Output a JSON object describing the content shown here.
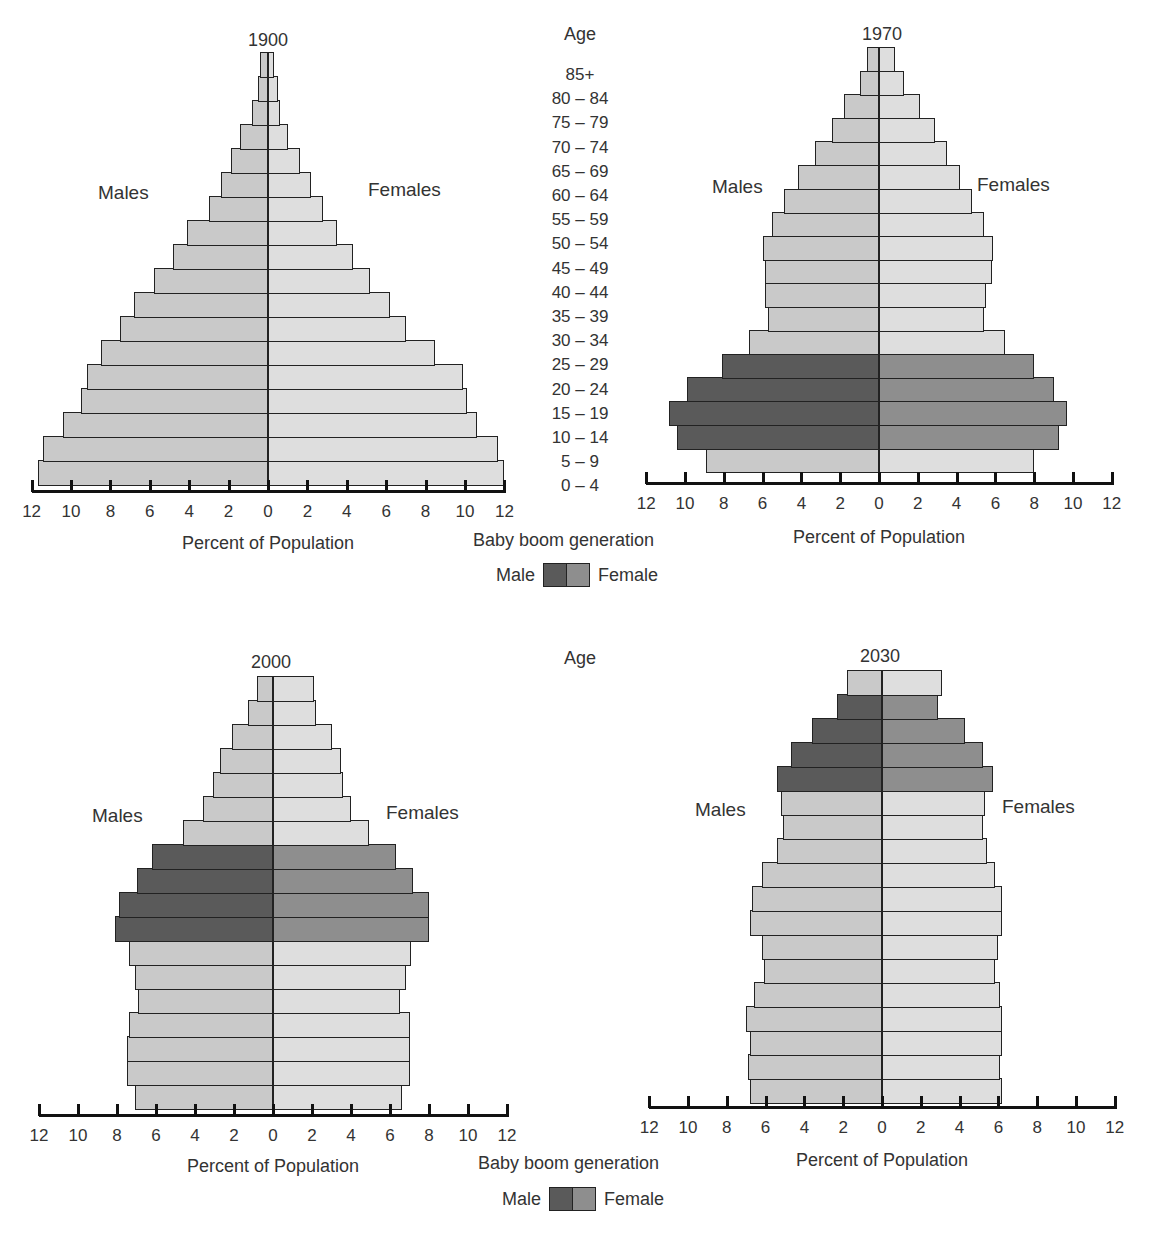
{
  "chart_data": [
    {
      "type": "bar",
      "subtype": "population-pyramid",
      "title": "1900",
      "xlabel": "Percent of Population",
      "xlim": [
        -12,
        12
      ],
      "xticks": [
        12,
        10,
        8,
        6,
        4,
        2,
        0,
        2,
        4,
        6,
        8,
        10,
        12
      ],
      "side_labels": {
        "left": "Males",
        "right": "Females"
      },
      "categories": [
        "0 – 4",
        "5 – 9",
        "10 – 14",
        "15 – 19",
        "20 – 24",
        "25 – 29",
        "30 – 34",
        "35 – 39",
        "40 – 44",
        "45 – 49",
        "50 – 54",
        "55 – 59",
        "60 – 64",
        "65 – 69",
        "70 – 74",
        "75 – 79",
        "80 – 84",
        "85+"
      ],
      "series": [
        {
          "name": "Males",
          "values": [
            11.7,
            11.4,
            10.4,
            9.5,
            9.2,
            8.5,
            7.5,
            6.8,
            5.8,
            4.8,
            4.1,
            3.0,
            2.4,
            1.9,
            1.4,
            0.8,
            0.5,
            0.4
          ]
        },
        {
          "name": "Females",
          "values": [
            12.0,
            11.7,
            10.6,
            10.1,
            9.9,
            8.5,
            7.0,
            6.2,
            5.2,
            4.3,
            3.5,
            2.8,
            2.2,
            1.6,
            1.0,
            0.6,
            0.5,
            0.3
          ]
        }
      ],
      "baby_boom_indices": []
    },
    {
      "type": "bar",
      "subtype": "population-pyramid",
      "title": "1970",
      "xlabel": "Percent of Population",
      "xlim": [
        -12,
        12
      ],
      "xticks": [
        12,
        10,
        8,
        6,
        4,
        2,
        0,
        2,
        4,
        6,
        8,
        10,
        12
      ],
      "side_labels": {
        "left": "Males",
        "right": "Females"
      },
      "categories": [
        "0 – 4",
        "5 – 9",
        "10 – 14",
        "15 – 19",
        "20 – 24",
        "25 – 29",
        "30 – 34",
        "35 – 39",
        "40 – 44",
        "45 – 49",
        "50 – 54",
        "55 – 59",
        "60 – 64",
        "65 – 69",
        "70 – 74",
        "75 – 79",
        "80 – 84",
        "85+"
      ],
      "series": [
        {
          "name": "Males",
          "values": [
            8.9,
            10.4,
            10.8,
            9.9,
            8.1,
            6.7,
            5.7,
            5.9,
            5.9,
            6.0,
            5.5,
            4.9,
            4.2,
            3.3,
            2.4,
            1.8,
            1.0,
            0.6
          ]
        },
        {
          "name": "Females",
          "values": [
            8.0,
            9.3,
            9.7,
            9.0,
            8.0,
            6.5,
            5.4,
            5.5,
            5.8,
            5.9,
            5.4,
            4.8,
            4.2,
            3.5,
            2.9,
            2.1,
            1.3,
            0.8
          ]
        }
      ],
      "baby_boom_indices": [
        1,
        2,
        3,
        4
      ]
    },
    {
      "type": "bar",
      "subtype": "population-pyramid",
      "title": "2000",
      "xlabel": "Percent of Population",
      "xlim": [
        -12,
        12
      ],
      "xticks": [
        12,
        10,
        8,
        6,
        4,
        2,
        0,
        2,
        4,
        6,
        8,
        10,
        12
      ],
      "side_labels": {
        "left": "Males",
        "right": "Females"
      },
      "categories": [
        "0 – 4",
        "5 – 9",
        "10 – 14",
        "15 – 19",
        "20 – 24",
        "25 – 29",
        "30 – 34",
        "35 – 39",
        "40 – 44",
        "45 – 49",
        "50 – 54",
        "55 – 59",
        "60 – 64",
        "65 – 69",
        "70 – 74",
        "75 – 79",
        "80 – 84",
        "85+"
      ],
      "series": [
        {
          "name": "Males",
          "values": [
            7.1,
            7.5,
            7.5,
            7.4,
            6.9,
            7.1,
            7.4,
            8.1,
            7.9,
            7.0,
            6.2,
            4.6,
            3.6,
            3.1,
            2.7,
            2.1,
            1.3,
            0.8
          ]
        },
        {
          "name": "Females",
          "values": [
            6.6,
            7.0,
            7.0,
            7.0,
            6.5,
            6.8,
            7.1,
            8.0,
            8.0,
            7.2,
            6.3,
            4.9,
            4.0,
            3.6,
            3.5,
            3.0,
            2.2,
            2.1
          ]
        }
      ],
      "baby_boom_indices": [
        7,
        8,
        9,
        10
      ]
    },
    {
      "type": "bar",
      "subtype": "population-pyramid",
      "title": "2030",
      "xlabel": "Percent of Population",
      "xlim": [
        -12,
        12
      ],
      "xticks": [
        12,
        10,
        8,
        6,
        4,
        2,
        0,
        2,
        4,
        6,
        8,
        10,
        12
      ],
      "side_labels": {
        "left": "Males",
        "right": "Females"
      },
      "categories": [
        "0 – 4",
        "5 – 9",
        "10 – 14",
        "15 – 19",
        "20 – 24",
        "25 – 29",
        "30 – 34",
        "35 – 39",
        "40 – 44",
        "45 – 49",
        "50 – 54",
        "55 – 59",
        "60 – 64",
        "65 – 69",
        "70 – 74",
        "75 – 79",
        "80 – 84",
        "85+"
      ],
      "series": [
        {
          "name": "Males",
          "values": [
            6.8,
            6.9,
            6.8,
            7.0,
            6.6,
            6.1,
            6.2,
            6.8,
            6.7,
            6.2,
            5.4,
            5.1,
            5.2,
            5.4,
            4.7,
            3.6,
            2.3,
            1.8
          ]
        },
        {
          "name": "Females",
          "values": [
            6.2,
            6.1,
            6.2,
            6.2,
            6.1,
            5.8,
            6.0,
            6.2,
            6.2,
            5.8,
            5.4,
            5.2,
            5.3,
            5.7,
            5.2,
            4.3,
            2.9,
            3.1
          ]
        }
      ],
      "baby_boom_indices": [
        13,
        14,
        15,
        16
      ]
    }
  ],
  "age_column": {
    "title": "Age",
    "labels": [
      "85+",
      "80 – 84",
      "75 – 79",
      "70 – 74",
      "65 – 69",
      "60 – 64",
      "55 – 59",
      "50 – 54",
      "45 – 49",
      "40 – 44",
      "35 – 39",
      "30 – 34",
      "25 – 29",
      "20 – 24",
      "15 – 19",
      "10 – 14",
      "5 – 9",
      "0 – 4"
    ]
  },
  "legend": {
    "caption": "Baby boom generation",
    "male_label": "Male",
    "female_label": "Female",
    "colors": {
      "male_boom": "#5a5a5a",
      "female_boom": "#8e8e8e",
      "male": "#c9c9c9",
      "female": "#dedede"
    }
  }
}
